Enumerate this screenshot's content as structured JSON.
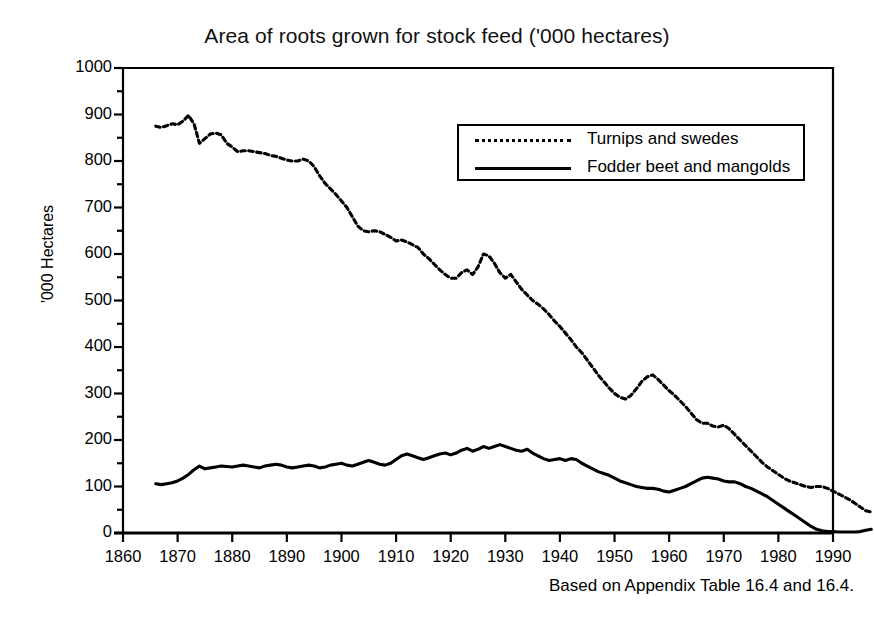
{
  "chart_data": {
    "type": "line",
    "title": "Area of roots grown for stock feed ('000 hectares)",
    "xlabel": "",
    "ylabel": "'000 Hectares",
    "caption": "Based on Appendix Table 16.4 and 16.4.",
    "xlim": [
      1860,
      1990
    ],
    "ylim": [
      0,
      1000
    ],
    "xticks": [
      1860,
      1870,
      1880,
      1890,
      1900,
      1910,
      1920,
      1930,
      1940,
      1950,
      1960,
      1970,
      1980,
      1990
    ],
    "yticks": [
      0,
      100,
      200,
      300,
      400,
      500,
      600,
      700,
      800,
      900,
      1000
    ],
    "yminor_step": 50,
    "grid": false,
    "legend_position": "upper-right-inside",
    "series": [
      {
        "name": "Turnips and swedes",
        "style": "dotted",
        "color": "#000000",
        "x_start": 1866,
        "x_end": 1987,
        "values": [
          875,
          872,
          876,
          880,
          878,
          886,
          898,
          880,
          838,
          848,
          858,
          860,
          856,
          838,
          830,
          820,
          822,
          822,
          820,
          818,
          816,
          812,
          810,
          806,
          802,
          800,
          800,
          804,
          800,
          788,
          768,
          752,
          740,
          728,
          714,
          700,
          680,
          660,
          650,
          648,
          650,
          648,
          642,
          636,
          628,
          630,
          626,
          620,
          614,
          600,
          590,
          578,
          566,
          556,
          548,
          548,
          560,
          566,
          556,
          572,
          600,
          596,
          580,
          560,
          548,
          556,
          540,
          524,
          512,
          500,
          492,
          482,
          470,
          456,
          444,
          430,
          416,
          400,
          388,
          372,
          356,
          340,
          326,
          312,
          300,
          292,
          288,
          296,
          310,
          326,
          336,
          340,
          330,
          318,
          306,
          296,
          284,
          272,
          258,
          244,
          236,
          236,
          230,
          228,
          232,
          224,
          212,
          200,
          188,
          176,
          164,
          152,
          142,
          134,
          126,
          118,
          112,
          108,
          104,
          100,
          98,
          100,
          100,
          96,
          90,
          84,
          78,
          72,
          64,
          56,
          48,
          45
        ]
      },
      {
        "name": "Fodder beet and mangolds",
        "style": "solid",
        "color": "#000000",
        "x_start": 1866,
        "x_end": 1987,
        "values": [
          106,
          104,
          106,
          108,
          112,
          118,
          126,
          136,
          144,
          138,
          140,
          142,
          144,
          143,
          142,
          144,
          146,
          144,
          142,
          140,
          144,
          146,
          148,
          146,
          142,
          140,
          142,
          144,
          146,
          144,
          140,
          142,
          146,
          148,
          150,
          146,
          144,
          148,
          152,
          156,
          152,
          148,
          146,
          150,
          158,
          166,
          170,
          166,
          162,
          158,
          162,
          166,
          170,
          172,
          168,
          172,
          178,
          182,
          176,
          180,
          186,
          182,
          186,
          190,
          186,
          182,
          178,
          176,
          180,
          172,
          166,
          160,
          156,
          158,
          160,
          156,
          160,
          158,
          150,
          144,
          138,
          132,
          128,
          124,
          118,
          112,
          108,
          104,
          100,
          98,
          96,
          96,
          94,
          90,
          88,
          92,
          96,
          100,
          106,
          112,
          118,
          120,
          118,
          116,
          112,
          110,
          110,
          106,
          100,
          96,
          90,
          84,
          78,
          70,
          62,
          54,
          46,
          38,
          30,
          22,
          14,
          8,
          5,
          3,
          3,
          2,
          2,
          2,
          2,
          3,
          6,
          8
        ]
      }
    ]
  },
  "axis": {
    "x_tick_labels": [
      "1860",
      "1870",
      "1880",
      "1890",
      "1900",
      "1910",
      "1920",
      "1930",
      "1940",
      "1950",
      "1960",
      "1970",
      "1980",
      "1990"
    ],
    "y_tick_labels": [
      "1000",
      "900",
      "800",
      "700",
      "600",
      "500",
      "400",
      "300",
      "200",
      "100",
      "0"
    ]
  },
  "legend": {
    "items": [
      {
        "label": "Turnips and swedes",
        "swatch": "dotted-line-swatch"
      },
      {
        "label": "Fodder beet and mangolds",
        "swatch": "solid-line-swatch"
      }
    ]
  }
}
